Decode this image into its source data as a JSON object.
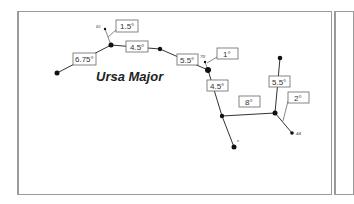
{
  "diagram": {
    "title": "Ursa Major",
    "stars": [
      {
        "id": "s1",
        "x": 57,
        "y": 73
      },
      {
        "id": "s2",
        "x": 111,
        "y": 45
      },
      {
        "id": "s3",
        "x": 160,
        "y": 49
      },
      {
        "id": "s4",
        "x": 208,
        "y": 70
      },
      {
        "id": "s5",
        "x": 222,
        "y": 116
      },
      {
        "id": "s6",
        "x": 275,
        "y": 113
      },
      {
        "id": "s7",
        "x": 280,
        "y": 58
      },
      {
        "id": "s8",
        "x": 234,
        "y": 147
      },
      {
        "id": "s9",
        "x": 292,
        "y": 133
      },
      {
        "id": "s10",
        "x": 105,
        "y": 29
      },
      {
        "id": "s11",
        "x": 205,
        "y": 62
      }
    ],
    "star_labels": [
      {
        "text": "81",
        "x": 96,
        "y": 28
      },
      {
        "text": "70",
        "x": 200,
        "y": 58
      },
      {
        "text": "44",
        "x": 296,
        "y": 135
      },
      {
        "text": "z",
        "x": 237,
        "y": 142
      }
    ],
    "angle_labels": [
      {
        "text": "1.5°",
        "x": 116,
        "y": 20,
        "w": 22,
        "h": 12
      },
      {
        "text": "4.5°",
        "x": 126,
        "y": 41,
        "w": 22,
        "h": 11
      },
      {
        "text": "6.75°",
        "x": 73,
        "y": 53,
        "w": 23,
        "h": 12
      },
      {
        "text": "5.5°",
        "x": 177,
        "y": 54,
        "w": 21,
        "h": 11
      },
      {
        "text": "1°",
        "x": 217,
        "y": 48,
        "w": 21,
        "h": 11
      },
      {
        "text": "4.5°",
        "x": 207,
        "y": 80,
        "w": 21,
        "h": 11
      },
      {
        "text": "8°",
        "x": 239,
        "y": 96,
        "w": 21,
        "h": 11
      },
      {
        "text": "5.5°",
        "x": 269,
        "y": 76,
        "w": 21,
        "h": 11
      },
      {
        "text": "2°",
        "x": 288,
        "y": 92,
        "w": 21,
        "h": 11
      }
    ]
  }
}
